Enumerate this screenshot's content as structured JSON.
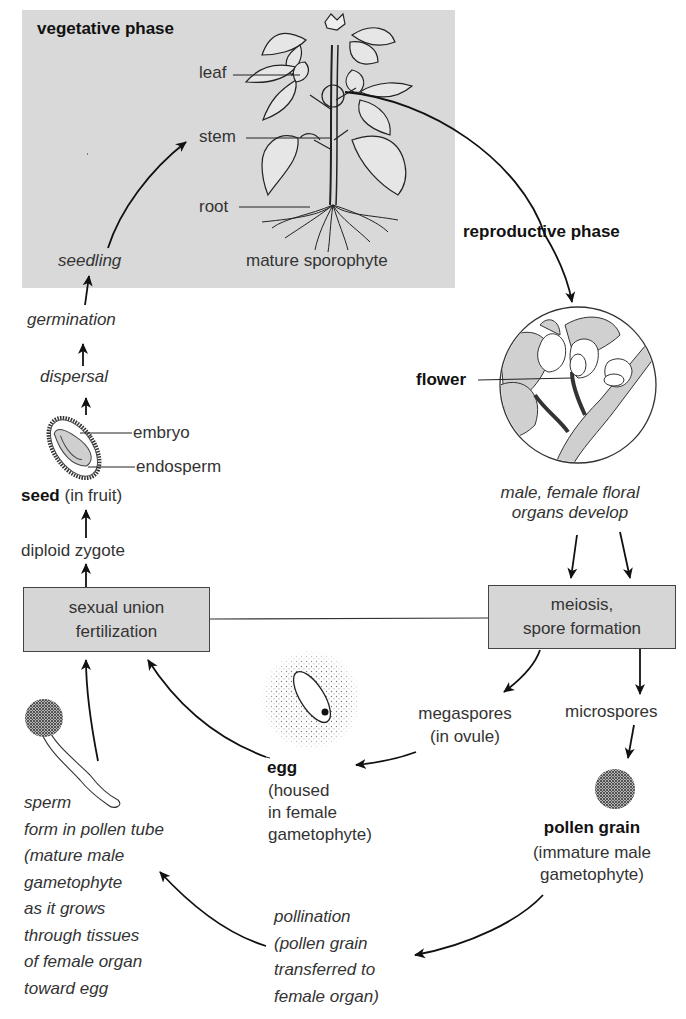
{
  "phases": {
    "vegetative": "vegetative phase",
    "reproductive": "reproductive phase"
  },
  "sporophyte": {
    "leaf": "leaf",
    "stem": "stem",
    "root": "root",
    "caption": "mature sporophyte"
  },
  "left_column": {
    "seedling": "seedling",
    "germination": "germination",
    "dispersal": "dispersal",
    "embryo": "embryo",
    "endosperm": "endosperm",
    "seed_bold": "seed",
    "seed_rest": " (in fruit)",
    "zygote": "diploid zygote"
  },
  "flower": {
    "label": "flower",
    "caption_line1": "male, female floral",
    "caption_line2": "organs develop"
  },
  "boxes": {
    "fertilization": [
      "sexual union",
      "fertilization"
    ],
    "meiosis": [
      "meiosis,",
      "spore formation"
    ]
  },
  "spores": {
    "megaspores": [
      "megaspores",
      "(in ovule)"
    ],
    "microspores": "microspores"
  },
  "egg": {
    "label": "egg",
    "desc": [
      "(housed",
      "in female",
      "gametophyte)"
    ]
  },
  "pollen_grain": {
    "label": "pollen grain",
    "desc": [
      "(immature male",
      "gametophyte)"
    ]
  },
  "sperm": {
    "lines": [
      "sperm",
      "form in pollen tube",
      "(mature male",
      "gametophyte",
      "as it grows",
      "through tissues",
      "of female organ",
      "toward egg"
    ]
  },
  "pollination": {
    "lines": [
      "pollination",
      "(pollen grain",
      "transferred to",
      "female organ)"
    ]
  },
  "colors": {
    "panel_gray": "#d9d9d9",
    "box_gray": "#d6d6d6",
    "ink": "#111111",
    "text": "#333333"
  }
}
